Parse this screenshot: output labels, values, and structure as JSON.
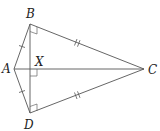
{
  "diagram": {
    "points": {
      "A": {
        "label": "A",
        "x": 14,
        "y": 69
      },
      "B": {
        "label": "B",
        "x": 30,
        "y": 24
      },
      "C": {
        "label": "C",
        "x": 144,
        "y": 69
      },
      "D": {
        "label": "D",
        "x": 30,
        "y": 113
      },
      "X": {
        "label": "X",
        "x": 30,
        "y": 69
      }
    },
    "segments": [
      "AB",
      "BC",
      "CD",
      "DA",
      "AC",
      "BD"
    ],
    "equal_marks": {
      "single": [
        "AB",
        "AD"
      ],
      "double": [
        "BC",
        "DC"
      ]
    },
    "right_angles": [
      "ABC",
      "AXB",
      "ADC"
    ],
    "colors": {
      "line": "#555555",
      "text": "#222222",
      "background": "#ffffff"
    }
  }
}
